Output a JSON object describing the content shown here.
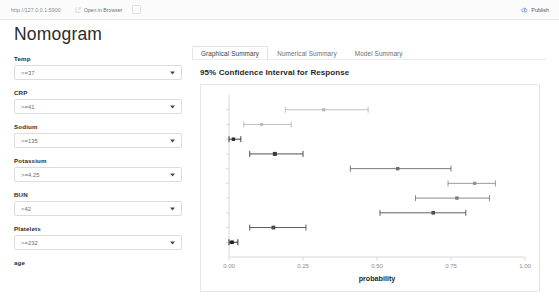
{
  "topbar": {
    "url": "http://127.0.0.1:5900",
    "open_in_browser_label": "Open in Browser",
    "open_in_browser_icon": "external-link-icon",
    "publish_label": "Publish",
    "publish_icon": "publish-cloud-icon"
  },
  "page": {
    "title": "Nomogram"
  },
  "sidebar": {
    "fields": [
      {
        "label": "Temp",
        "value": ">=37",
        "caret_icon": "chevron-down-icon"
      },
      {
        "label": "CRP",
        "value": ">=41",
        "caret_icon": "chevron-down-icon"
      },
      {
        "label": "Sodium",
        "value": ">=135",
        "caret_icon": "chevron-down-icon"
      },
      {
        "label": "Potassium",
        "value": ">=4.25",
        "caret_icon": "chevron-down-icon"
      },
      {
        "label": "BUN",
        "value": "<42",
        "caret_icon": "chevron-down-icon"
      },
      {
        "label": "Platelets",
        "value": ">=232",
        "caret_icon": "chevron-down-icon"
      }
    ],
    "trailing_label": "age"
  },
  "main": {
    "tabs": [
      {
        "label": "Graphical Summary",
        "active": true
      },
      {
        "label": "Numerical Summary",
        "active": false
      },
      {
        "label": "Model Summary",
        "active": false
      }
    ]
  },
  "chart_data": {
    "type": "scatter",
    "title": "95% Confidence Interval for Response",
    "xlabel": "probability",
    "ylabel": "",
    "xlim": [
      0.0,
      1.0
    ],
    "xticks": [
      0.0,
      0.25,
      0.5,
      0.75,
      1.0
    ],
    "xticklabels": [
      "0.00",
      "0.25",
      "0.50",
      "0.75",
      "1.00"
    ],
    "yticklabels": [],
    "grid": false,
    "legend": null,
    "orientation": "horizontal-error-bars",
    "colors": {
      "light": "#b9b9b9",
      "medium": "#8f8f8f",
      "dark": "#4a4a4a",
      "darkest": "#1c1c1c",
      "axis": "#cfcfcf"
    },
    "points": [
      {
        "index": 1,
        "estimate": 0.32,
        "ci_low": 0.19,
        "ci_high": 0.47,
        "color": "#b9b9b9",
        "size": 3.2
      },
      {
        "index": 2,
        "estimate": 0.11,
        "ci_low": 0.05,
        "ci_high": 0.21,
        "color": "#b9b9b9",
        "size": 3.0
      },
      {
        "index": 3,
        "estimate": 0.015,
        "ci_low": 0.0,
        "ci_high": 0.04,
        "color": "#2a2a2a",
        "size": 3.4
      },
      {
        "index": 4,
        "estimate": 0.155,
        "ci_low": 0.07,
        "ci_high": 0.25,
        "color": "#3a3a3a",
        "size": 4.0
      },
      {
        "index": 5,
        "estimate": 0.57,
        "ci_low": 0.41,
        "ci_high": 0.75,
        "color": "#6b6b6b",
        "size": 3.4
      },
      {
        "index": 6,
        "estimate": 0.83,
        "ci_low": 0.74,
        "ci_high": 0.9,
        "color": "#8f8f8f",
        "size": 3.2
      },
      {
        "index": 7,
        "estimate": 0.77,
        "ci_low": 0.63,
        "ci_high": 0.88,
        "color": "#7d7d7d",
        "size": 3.4
      },
      {
        "index": 8,
        "estimate": 0.69,
        "ci_low": 0.51,
        "ci_high": 0.8,
        "color": "#4f4f4f",
        "size": 3.6
      },
      {
        "index": 9,
        "estimate": 0.15,
        "ci_low": 0.07,
        "ci_high": 0.26,
        "color": "#4a4a4a",
        "size": 3.8
      },
      {
        "index": 10,
        "estimate": 0.01,
        "ci_low": 0.0,
        "ci_high": 0.03,
        "color": "#1c1c1c",
        "size": 3.6
      }
    ]
  }
}
